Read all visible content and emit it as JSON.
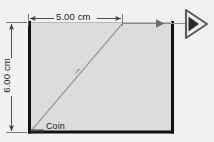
{
  "figure": {
    "type": "optics-ray-diagram",
    "background_color": "#f1f1f1",
    "liquid_fill_color": "#dcdcdc",
    "wall_color": "#111111",
    "ray_color": "#8a8a8a",
    "dimension_color": "#3a3a3a"
  },
  "labels": {
    "width_dimension": "5.00 cm",
    "height_dimension": "6.00 cm",
    "object_label": "Coin"
  },
  "icons": {
    "eye": "eye-icon",
    "ray_arrow": "arrowhead-icon",
    "dimension_arrow": "dimension-arrow-icon"
  },
  "geometry": {
    "container": {
      "left": 28,
      "top": 22,
      "right": 174,
      "bottom": 133
    },
    "width_dimension_line": {
      "x1": 28,
      "x2": 122,
      "y": 18
    },
    "height_dimension_line": {
      "x": 11,
      "y1": 22,
      "y2": 132
    },
    "coin_point": {
      "x": 31,
      "y": 131
    },
    "diagonal_ray": {
      "x1": 31,
      "y1": 131,
      "x2": 122,
      "y2": 24
    },
    "horizontal_ray": {
      "x1": 122,
      "y1": 24,
      "x2": 186,
      "y2": 24
    },
    "eye_position": {
      "x": 195,
      "y": 24
    }
  }
}
